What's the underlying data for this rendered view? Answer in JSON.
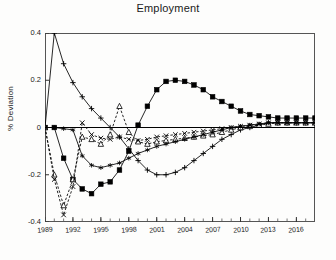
{
  "chart_data": {
    "type": "line",
    "title": "Employment",
    "xlabel": "",
    "ylabel": "% Deviation",
    "xlim": [
      1989,
      2018
    ],
    "ylim": [
      -0.4,
      0.4
    ],
    "yticks": [
      0.4,
      0.2,
      0,
      -0.2,
      -0.4
    ],
    "ytick_labels": [
      "0.4",
      "0.2",
      "0",
      "-0.2",
      "-0.4"
    ],
    "xticks": [
      1989,
      1992,
      1995,
      1998,
      2001,
      2004,
      2007,
      2010,
      2013,
      2016
    ],
    "xtick_labels": [
      "1989",
      "1992",
      "1995",
      "1998",
      "2001",
      "2004",
      "2007",
      "2010",
      "2013",
      "2016"
    ],
    "grid": false,
    "legend": "none",
    "x": [
      1989,
      1990,
      1991,
      1992,
      1993,
      1994,
      1995,
      1996,
      1997,
      1998,
      1999,
      2000,
      2001,
      2002,
      2003,
      2004,
      2005,
      2006,
      2007,
      2008,
      2009,
      2010,
      2011,
      2012,
      2013,
      2014,
      2015,
      2016,
      2017,
      2018
    ],
    "series": [
      {
        "name": "plus-series",
        "marker": "plus",
        "linestyle": "solid",
        "values": [
          0.0,
          0.4,
          0.27,
          0.19,
          0.13,
          0.08,
          0.04,
          0.0,
          -0.04,
          -0.09,
          -0.14,
          -0.18,
          -0.2,
          -0.2,
          -0.19,
          -0.17,
          -0.14,
          -0.11,
          -0.08,
          -0.05,
          -0.03,
          -0.01,
          0.0,
          0.01,
          0.02,
          0.02,
          0.02,
          0.02,
          0.02,
          0.02
        ]
      },
      {
        "name": "filled-square-series",
        "marker": "filled-square",
        "linestyle": "solid",
        "values": [
          0.0,
          0.0,
          -0.13,
          -0.22,
          -0.26,
          -0.28,
          -0.24,
          -0.23,
          -0.18,
          -0.1,
          0.01,
          0.09,
          0.16,
          0.195,
          0.2,
          0.195,
          0.18,
          0.16,
          0.13,
          0.11,
          0.09,
          0.07,
          0.055,
          0.05,
          0.045,
          0.04,
          0.04,
          0.04,
          0.04,
          0.04
        ]
      },
      {
        "name": "open-triangle-series",
        "marker": "open-triangle",
        "linestyle": "dashed",
        "values": [
          0.0,
          -0.2,
          -0.33,
          -0.22,
          -0.04,
          -0.05,
          -0.07,
          -0.03,
          0.09,
          -0.02,
          -0.06,
          -0.07,
          -0.06,
          -0.055,
          -0.05,
          -0.045,
          -0.04,
          -0.035,
          -0.03,
          -0.02,
          -0.01,
          0.0,
          0.005,
          0.01,
          0.015,
          0.02,
          0.02,
          0.02,
          0.02,
          0.02
        ]
      },
      {
        "name": "x-marker-series",
        "marker": "x",
        "linestyle": "dashed",
        "values": [
          0.0,
          -0.22,
          -0.37,
          -0.25,
          0.02,
          -0.03,
          -0.045,
          -0.05,
          -0.04,
          -0.05,
          -0.055,
          -0.05,
          -0.04,
          -0.035,
          -0.03,
          -0.025,
          -0.02,
          -0.015,
          -0.01,
          -0.005,
          0.0,
          0.005,
          0.01,
          0.015,
          0.02,
          0.02,
          0.02,
          0.02,
          0.02,
          0.02
        ]
      },
      {
        "name": "star-series",
        "marker": "star",
        "linestyle": "solid",
        "values": [
          0.0,
          0.0,
          -0.005,
          -0.01,
          -0.12,
          -0.16,
          -0.17,
          -0.16,
          -0.15,
          -0.13,
          -0.11,
          -0.095,
          -0.08,
          -0.07,
          -0.06,
          -0.05,
          -0.04,
          -0.03,
          -0.02,
          -0.01,
          0.0,
          0.005,
          0.01,
          0.015,
          0.02,
          0.02,
          0.02,
          0.02,
          0.02,
          0.02
        ]
      },
      {
        "name": "zero-line",
        "marker": "none",
        "linestyle": "solid",
        "values": [
          0,
          0,
          0,
          0,
          0,
          0,
          0,
          0,
          0,
          0,
          0,
          0,
          0,
          0,
          0,
          0,
          0,
          0,
          0,
          0,
          0,
          0,
          0,
          0,
          0,
          0,
          0,
          0,
          0,
          0
        ]
      }
    ]
  }
}
